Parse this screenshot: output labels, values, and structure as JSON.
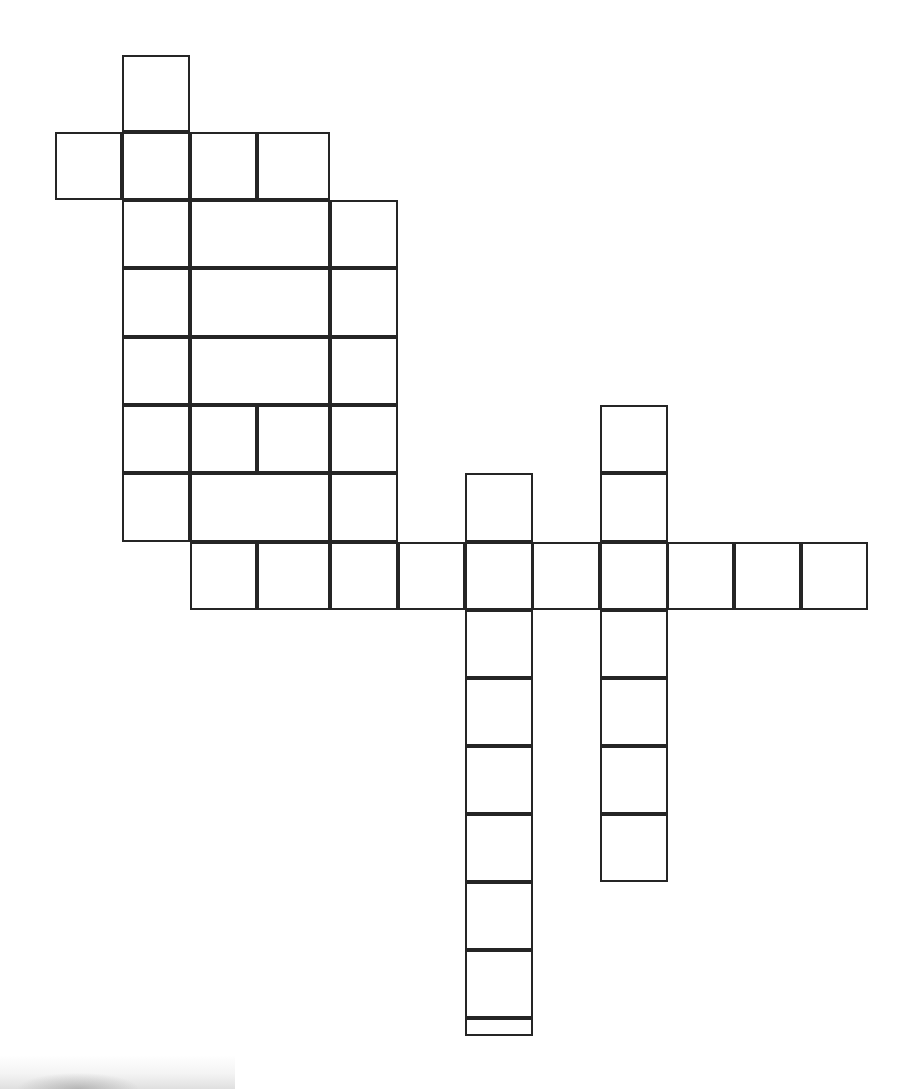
{
  "document": {
    "kind": "crossword-puzzle-grid",
    "title": "Blank Crossword Puzzle Grid",
    "background_color": "#ffffff",
    "line_color": "#252525",
    "line_width_px": 2,
    "canvas_width_px": 918,
    "canvas_height_px": 1089
  },
  "grid": {
    "cell_size_px": 67.5,
    "origin_x_px": 55,
    "origin_y_px": 55,
    "columns": 13,
    "rows": 15,
    "column_x_px": [
      55,
      122,
      190,
      257,
      330,
      398,
      465,
      532,
      600,
      667,
      734,
      801,
      868
    ],
    "row_y_px": [
      55,
      132,
      200,
      268,
      337,
      405,
      473,
      542,
      610,
      678,
      746,
      814,
      882,
      950,
      1018
    ],
    "filled_cell_count": 47,
    "empty_letters": true
  },
  "cells": [
    {
      "id": "r0c1",
      "row": 0,
      "col": 1,
      "x": 122,
      "y": 55,
      "w": 68,
      "h": 77,
      "letter": ""
    },
    {
      "id": "r1c0",
      "row": 1,
      "col": 0,
      "x": 55,
      "y": 132,
      "w": 67,
      "h": 68,
      "letter": ""
    },
    {
      "id": "r1c1",
      "row": 1,
      "col": 1,
      "x": 122,
      "y": 132,
      "w": 68,
      "h": 68,
      "letter": ""
    },
    {
      "id": "r1c2",
      "row": 1,
      "col": 2,
      "x": 190,
      "y": 132,
      "w": 67,
      "h": 68,
      "letter": ""
    },
    {
      "id": "r1c3",
      "row": 1,
      "col": 3,
      "x": 257,
      "y": 132,
      "w": 73,
      "h": 68,
      "letter": ""
    },
    {
      "id": "r2c1",
      "row": 2,
      "col": 1,
      "x": 122,
      "y": 200,
      "w": 68,
      "h": 68,
      "letter": ""
    },
    {
      "id": "r2c23",
      "row": 2,
      "col": 2,
      "x": 190,
      "y": 200,
      "w": 140,
      "h": 68,
      "letter": "",
      "span": 2,
      "open": true
    },
    {
      "id": "r2c4",
      "row": 2,
      "col": 4,
      "x": 330,
      "y": 200,
      "w": 68,
      "h": 68,
      "letter": ""
    },
    {
      "id": "r3c1",
      "row": 3,
      "col": 1,
      "x": 122,
      "y": 268,
      "w": 68,
      "h": 69,
      "letter": ""
    },
    {
      "id": "r3c23",
      "row": 3,
      "col": 2,
      "x": 190,
      "y": 268,
      "w": 140,
      "h": 69,
      "letter": "",
      "span": 2,
      "open": true
    },
    {
      "id": "r3c4",
      "row": 3,
      "col": 4,
      "x": 330,
      "y": 268,
      "w": 68,
      "h": 69,
      "letter": ""
    },
    {
      "id": "r4c1",
      "row": 4,
      "col": 1,
      "x": 122,
      "y": 337,
      "w": 68,
      "h": 68,
      "letter": ""
    },
    {
      "id": "r4c23",
      "row": 4,
      "col": 2,
      "x": 190,
      "y": 337,
      "w": 140,
      "h": 68,
      "letter": "",
      "span": 2,
      "open": true
    },
    {
      "id": "r4c4",
      "row": 4,
      "col": 4,
      "x": 330,
      "y": 337,
      "w": 68,
      "h": 68,
      "letter": ""
    },
    {
      "id": "r5c1",
      "row": 5,
      "col": 1,
      "x": 122,
      "y": 405,
      "w": 68,
      "h": 68,
      "letter": ""
    },
    {
      "id": "r5c2",
      "row": 5,
      "col": 2,
      "x": 190,
      "y": 405,
      "w": 67,
      "h": 68,
      "letter": ""
    },
    {
      "id": "r5c3",
      "row": 5,
      "col": 3,
      "x": 257,
      "y": 405,
      "w": 73,
      "h": 68,
      "letter": ""
    },
    {
      "id": "r5c4",
      "row": 5,
      "col": 4,
      "x": 330,
      "y": 405,
      "w": 68,
      "h": 68,
      "letter": ""
    },
    {
      "id": "r5c8",
      "row": 5,
      "col": 8,
      "x": 600,
      "y": 405,
      "w": 68,
      "h": 68,
      "letter": ""
    },
    {
      "id": "r6c1",
      "row": 6,
      "col": 1,
      "x": 122,
      "y": 473,
      "w": 68,
      "h": 69,
      "letter": ""
    },
    {
      "id": "r6c23",
      "row": 6,
      "col": 2,
      "x": 190,
      "y": 473,
      "w": 140,
      "h": 69,
      "letter": "",
      "span": 2,
      "open": true
    },
    {
      "id": "r6c4",
      "row": 6,
      "col": 4,
      "x": 330,
      "y": 473,
      "w": 68,
      "h": 69,
      "letter": ""
    },
    {
      "id": "r6c6",
      "row": 6,
      "col": 6,
      "x": 465,
      "y": 473,
      "w": 68,
      "h": 69,
      "letter": ""
    },
    {
      "id": "r6c8",
      "row": 6,
      "col": 8,
      "x": 600,
      "y": 473,
      "w": 68,
      "h": 69,
      "letter": ""
    },
    {
      "id": "r7c2",
      "row": 7,
      "col": 2,
      "x": 190,
      "y": 542,
      "w": 67,
      "h": 68,
      "letter": ""
    },
    {
      "id": "r7c3",
      "row": 7,
      "col": 3,
      "x": 257,
      "y": 542,
      "w": 73,
      "h": 68,
      "letter": ""
    },
    {
      "id": "r7c4",
      "row": 7,
      "col": 4,
      "x": 330,
      "y": 542,
      "w": 68,
      "h": 68,
      "letter": ""
    },
    {
      "id": "r7c5",
      "row": 7,
      "col": 5,
      "x": 398,
      "y": 542,
      "w": 67,
      "h": 68,
      "letter": ""
    },
    {
      "id": "r7c6",
      "row": 7,
      "col": 6,
      "x": 465,
      "y": 542,
      "w": 68,
      "h": 68,
      "letter": ""
    },
    {
      "id": "r7c7",
      "row": 7,
      "col": 7,
      "x": 532,
      "y": 542,
      "w": 68,
      "h": 68,
      "letter": ""
    },
    {
      "id": "r7c8",
      "row": 7,
      "col": 8,
      "x": 600,
      "y": 542,
      "w": 68,
      "h": 68,
      "letter": ""
    },
    {
      "id": "r7c9",
      "row": 7,
      "col": 9,
      "x": 667,
      "y": 542,
      "w": 67,
      "h": 68,
      "letter": ""
    },
    {
      "id": "r7c10",
      "row": 7,
      "col": 10,
      "x": 734,
      "y": 542,
      "w": 67,
      "h": 68,
      "letter": ""
    },
    {
      "id": "r7c11",
      "row": 7,
      "col": 11,
      "x": 801,
      "y": 542,
      "w": 67,
      "h": 68,
      "letter": ""
    },
    {
      "id": "r8c6",
      "row": 8,
      "col": 6,
      "x": 465,
      "y": 610,
      "w": 68,
      "h": 68,
      "letter": ""
    },
    {
      "id": "r8c8",
      "row": 8,
      "col": 8,
      "x": 600,
      "y": 610,
      "w": 68,
      "h": 68,
      "letter": ""
    },
    {
      "id": "r9c6",
      "row": 9,
      "col": 6,
      "x": 465,
      "y": 678,
      "w": 68,
      "h": 68,
      "letter": ""
    },
    {
      "id": "r9c8",
      "row": 9,
      "col": 8,
      "x": 600,
      "y": 678,
      "w": 68,
      "h": 68,
      "letter": ""
    },
    {
      "id": "r10c6",
      "row": 10,
      "col": 6,
      "x": 465,
      "y": 746,
      "w": 68,
      "h": 68,
      "letter": ""
    },
    {
      "id": "r10c8",
      "row": 10,
      "col": 8,
      "x": 600,
      "y": 746,
      "w": 68,
      "h": 68,
      "letter": ""
    },
    {
      "id": "r11c6",
      "row": 11,
      "col": 6,
      "x": 465,
      "y": 814,
      "w": 68,
      "h": 68,
      "letter": ""
    },
    {
      "id": "r11c8",
      "row": 11,
      "col": 8,
      "x": 600,
      "y": 814,
      "w": 68,
      "h": 68,
      "letter": ""
    },
    {
      "id": "r12c6",
      "row": 12,
      "col": 6,
      "x": 465,
      "y": 882,
      "w": 68,
      "h": 68,
      "letter": ""
    },
    {
      "id": "r13c6",
      "row": 13,
      "col": 6,
      "x": 465,
      "y": 950,
      "w": 68,
      "h": 68,
      "letter": ""
    },
    {
      "id": "r14c6",
      "row": 14,
      "col": 6,
      "x": 465,
      "y": 1018,
      "w": 68,
      "h": 18,
      "letter": ""
    }
  ]
}
